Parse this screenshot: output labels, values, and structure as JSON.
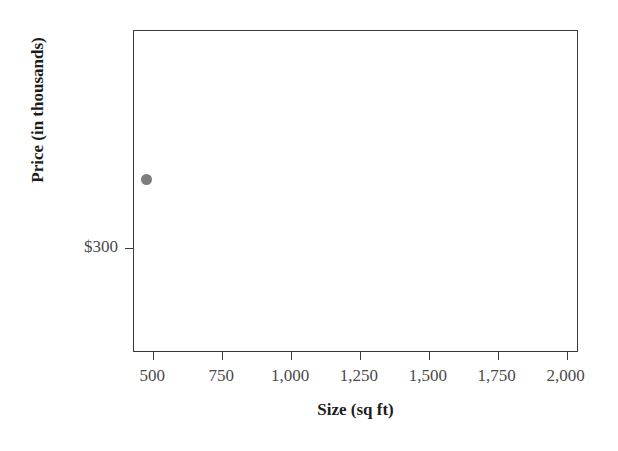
{
  "chart_data": {
    "type": "scatter",
    "title": "",
    "xlabel": "Size (sq ft)",
    "ylabel": "Price (in thousands)",
    "xlim": [
      430,
      2045
    ],
    "ylim": [
      283,
      335
    ],
    "xticks": [
      500,
      750,
      1000,
      1250,
      1500,
      1750,
      2000
    ],
    "xticklabels": [
      "500",
      "750",
      "1,000",
      "1,250",
      "1,500",
      "1,750",
      "2,000"
    ],
    "yticks": [
      300,
      350,
      400,
      450,
      500,
      550,
      600,
      650
    ],
    "yticklabels": [
      "$300",
      "$350",
      "$400",
      "$450",
      "$500",
      "$550",
      "$600",
      "$650"
    ],
    "grid": false,
    "legend": null,
    "marker_color": "#7d7d7d",
    "marker_size": 11,
    "frame_color": "#3a3a3a",
    "points": [
      {
        "x": 475,
        "y": 311
      },
      {
        "x": 725,
        "y": 414
      },
      {
        "x": 880,
        "y": 360
      },
      {
        "x": 1020,
        "y": 345
      },
      {
        "x": 947,
        "y": 471
      },
      {
        "x": 1012,
        "y": 475
      },
      {
        "x": 1118,
        "y": 541
      },
      {
        "x": 1169,
        "y": 520
      },
      {
        "x": 1158,
        "y": 492
      },
      {
        "x": 1241,
        "y": 460
      },
      {
        "x": 1415,
        "y": 470
      },
      {
        "x": 1495,
        "y": 470
      },
      {
        "x": 1525,
        "y": 576
      },
      {
        "x": 1536,
        "y": 567
      },
      {
        "x": 1547,
        "y": 511
      },
      {
        "x": 1532,
        "y": 501
      },
      {
        "x": 1615,
        "y": 475
      },
      {
        "x": 1666,
        "y": 491
      },
      {
        "x": 1750,
        "y": 580
      },
      {
        "x": 1840,
        "y": 625
      }
    ]
  },
  "axes": {
    "x_title": "Size (sq ft)",
    "y_title": "Price (in thousands)"
  }
}
